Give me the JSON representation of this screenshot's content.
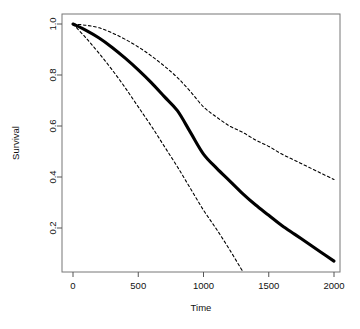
{
  "chart_data": {
    "type": "line",
    "title": "",
    "xlabel": "Time",
    "ylabel": "Survival",
    "xlim": [
      0,
      2000
    ],
    "ylim": [
      0.0,
      1.05
    ],
    "grid": false,
    "legend": "none",
    "background_color": "#ffffff",
    "box_color": "#777777",
    "xticks": [
      0,
      500,
      1000,
      1500,
      2000
    ],
    "xtick_labels": [
      "0",
      "500",
      "1000",
      "1500",
      "2000"
    ],
    "yticks": [
      0.2,
      0.4,
      0.6,
      0.8,
      1.0
    ],
    "ytick_labels": [
      "0.2",
      "0.4",
      "0.6",
      "0.8",
      "1.0"
    ],
    "series": [
      {
        "name": "Survival estimate",
        "style": "solid",
        "color": "#000000",
        "width": 3.1,
        "x": [
          0,
          100,
          200,
          300,
          400,
          500,
          600,
          700,
          800,
          900,
          1000,
          1100,
          1200,
          1300,
          1400,
          1500,
          1600,
          1700,
          1800,
          1900,
          2000
        ],
        "values": [
          1.0,
          0.975,
          0.945,
          0.908,
          0.866,
          0.82,
          0.77,
          0.715,
          0.66,
          0.575,
          0.49,
          0.435,
          0.385,
          0.335,
          0.29,
          0.25,
          0.21,
          0.175,
          0.14,
          0.105,
          0.07
        ]
      },
      {
        "name": "Upper confidence limit",
        "style": "dashed",
        "color": "#000000",
        "width": 1.1,
        "x": [
          0,
          100,
          200,
          300,
          400,
          500,
          600,
          700,
          800,
          900,
          1000,
          1100,
          1200,
          1300,
          1400,
          1500,
          1600,
          1700,
          1800,
          1900,
          2000
        ],
        "values": [
          1.0,
          0.995,
          0.985,
          0.965,
          0.94,
          0.91,
          0.875,
          0.835,
          0.79,
          0.735,
          0.675,
          0.635,
          0.6,
          0.575,
          0.545,
          0.52,
          0.49,
          0.465,
          0.44,
          0.415,
          0.39
        ]
      },
      {
        "name": "Lower confidence limit",
        "style": "dashed",
        "color": "#000000",
        "width": 1.1,
        "x": [
          0,
          100,
          200,
          300,
          400,
          500,
          600,
          700,
          800,
          900,
          1000,
          1100,
          1200,
          1300
        ],
        "values": [
          1.0,
          0.945,
          0.885,
          0.82,
          0.75,
          0.675,
          0.6,
          0.52,
          0.44,
          0.355,
          0.27,
          0.195,
          0.115,
          0.03
        ]
      }
    ]
  },
  "axes": {
    "x_title": "Time",
    "y_title": "Survival"
  }
}
